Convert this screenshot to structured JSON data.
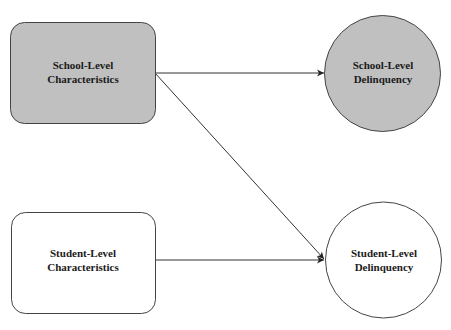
{
  "diagram": {
    "nodes": [
      {
        "id": "school_chars",
        "shape": "rounded-rect",
        "lines": [
          "School-Level",
          "Characteristics"
        ],
        "fill": "#c0c0c0"
      },
      {
        "id": "school_delinq",
        "shape": "circle",
        "lines": [
          "School-Level",
          "Delinquency"
        ],
        "fill": "#c0c0c0"
      },
      {
        "id": "student_chars",
        "shape": "rounded-rect",
        "lines": [
          "Student-Level",
          "Characteristics"
        ],
        "fill": "#ffffff"
      },
      {
        "id": "student_delinq",
        "shape": "circle",
        "lines": [
          "Student-Level",
          "Delinquency"
        ],
        "fill": "#ffffff"
      }
    ],
    "edges": [
      {
        "from": "school_chars",
        "to": "school_delinq"
      },
      {
        "from": "school_chars",
        "to": "student_delinq"
      },
      {
        "from": "student_chars",
        "to": "student_delinq"
      }
    ],
    "stroke_color": "#333333"
  }
}
